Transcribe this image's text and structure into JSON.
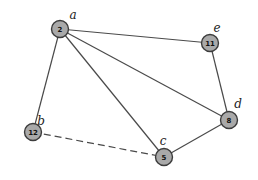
{
  "diagram": {
    "type": "undirected-graph",
    "nodes": [
      {
        "id": "a",
        "label": "a",
        "value": "2",
        "x": 60,
        "y": 29,
        "lx": 73,
        "ly": 15
      },
      {
        "id": "e",
        "label": "e",
        "value": "11",
        "x": 210,
        "y": 43,
        "lx": 217,
        "ly": 28
      },
      {
        "id": "b",
        "label": "b",
        "value": "12",
        "x": 33,
        "y": 132,
        "lx": 41,
        "ly": 121
      },
      {
        "id": "d",
        "label": "d",
        "value": "8",
        "x": 229,
        "y": 120,
        "lx": 238,
        "ly": 104
      },
      {
        "id": "c",
        "label": "c",
        "value": "5",
        "x": 164,
        "y": 157,
        "lx": 163,
        "ly": 141
      }
    ],
    "edges": [
      {
        "from": "a",
        "to": "e",
        "style": "solid"
      },
      {
        "from": "a",
        "to": "b",
        "style": "solid"
      },
      {
        "from": "a",
        "to": "c",
        "style": "solid"
      },
      {
        "from": "a",
        "to": "d",
        "style": "solid"
      },
      {
        "from": "e",
        "to": "d",
        "style": "solid"
      },
      {
        "from": "d",
        "to": "c",
        "style": "solid"
      },
      {
        "from": "b",
        "to": "c",
        "style": "dashed"
      }
    ],
    "colors": {
      "node_fill": "#a9a9a9",
      "node_stroke": "#3c3c3c",
      "edge": "#4a4a4a",
      "background": "#ffffff"
    }
  }
}
